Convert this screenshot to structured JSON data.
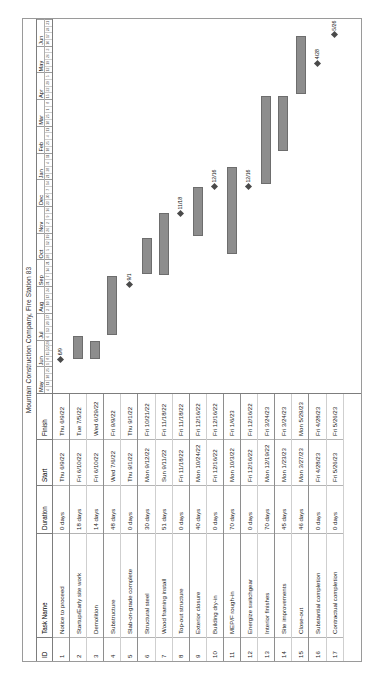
{
  "chart_data": {
    "type": "bar",
    "title": "Mountain Construction Company, Fire Station 83",
    "xlabel": "",
    "ylabel": "",
    "orientation": "horizontal",
    "timeline_start": "2022-05",
    "timeline_end": "2023-06",
    "months": [
      "May",
      "Jun",
      "Jul",
      "Aug",
      "Sep",
      "Oct",
      "Nov",
      "Dec",
      "Jan",
      "Feb",
      "Mar",
      "Apr",
      "May",
      "Jun"
    ],
    "columns": [
      "ID",
      "Task Name",
      "Duration",
      "Start",
      "Finish"
    ],
    "categories": [
      "Notice to proceed",
      "Startup/Early site work",
      "Demolition",
      "Substructure",
      "Slab-on-grade complete",
      "Structural steel",
      "Wood framing install",
      "Top-out structure",
      "Exterior closure",
      "Building dry-in",
      "MEP/F rough-in",
      "Energize switchgear",
      "Interior finishes",
      "Site improvements",
      "Close-out",
      "Substantial completion",
      "Contractual completion"
    ],
    "values": [
      0,
      18,
      14,
      48,
      0,
      30,
      51,
      0,
      40,
      0,
      70,
      0,
      70,
      45,
      46,
      0,
      0
    ],
    "rows": [
      {
        "id": "1",
        "name": "Notice to proceed",
        "duration": "0 days",
        "start": "Thu 6/9/22",
        "finish": "Thu 6/9/22",
        "bar_start": 0.09,
        "bar_end": 0.09,
        "milestone": true,
        "label": "6/9"
      },
      {
        "id": "2",
        "name": "Startup/Early site work",
        "duration": "18 days",
        "start": "Fri 6/10/22",
        "finish": "Tue 7/5/22",
        "bar_start": 0.092,
        "bar_end": 0.152,
        "milestone": false,
        "label": ""
      },
      {
        "id": "3",
        "name": "Demolition",
        "duration": "14 days",
        "start": "Fri 6/10/22",
        "finish": "Wed 6/29/22",
        "bar_start": 0.092,
        "bar_end": 0.138,
        "milestone": false,
        "label": ""
      },
      {
        "id": "4",
        "name": "Substructure",
        "duration": "48 days",
        "start": "Wed 7/6/22",
        "finish": "Fri 9/9/22",
        "bar_start": 0.155,
        "bar_end": 0.312,
        "milestone": false,
        "label": ""
      },
      {
        "id": "5",
        "name": "Slab-on-grade complete",
        "duration": "0 days",
        "start": "Thu 9/1/22",
        "finish": "Thu 9/1/22",
        "bar_start": 0.29,
        "bar_end": 0.29,
        "milestone": true,
        "label": "9/1"
      },
      {
        "id": "6",
        "name": "Structural steel",
        "duration": "30 days",
        "start": "Mon 9/12/22",
        "finish": "Fri 10/21/22",
        "bar_start": 0.318,
        "bar_end": 0.415,
        "milestone": false,
        "label": ""
      },
      {
        "id": "7",
        "name": "Wood framing install",
        "duration": "51 days",
        "start": "Sun 9/11/22",
        "finish": "Fri 11/18/22",
        "bar_start": 0.315,
        "bar_end": 0.48,
        "milestone": false,
        "label": ""
      },
      {
        "id": "8",
        "name": "Top-out structure",
        "duration": "0 days",
        "start": "Fri 11/18/22",
        "finish": "Fri 11/18/22",
        "bar_start": 0.48,
        "bar_end": 0.48,
        "milestone": true,
        "label": "11/18"
      },
      {
        "id": "9",
        "name": "Exterior closure",
        "duration": "40 days",
        "start": "Mon 10/24/22",
        "finish": "Fri 12/16/22",
        "bar_start": 0.42,
        "bar_end": 0.552,
        "milestone": false,
        "label": ""
      },
      {
        "id": "10",
        "name": "Building dry-in",
        "duration": "0 days",
        "start": "Fri 12/16/22",
        "finish": "Fri 12/16/22",
        "bar_start": 0.552,
        "bar_end": 0.552,
        "milestone": true,
        "label": "12/16"
      },
      {
        "id": "11",
        "name": "MEP/F rough-in",
        "duration": "70 days",
        "start": "Mon 10/3/22",
        "finish": "Fri 1/6/23",
        "bar_start": 0.372,
        "bar_end": 0.605,
        "milestone": false,
        "label": ""
      },
      {
        "id": "12",
        "name": "Energize switchgear",
        "duration": "0 days",
        "start": "Fri 12/16/22",
        "finish": "Fri 12/16/22",
        "bar_start": 0.552,
        "bar_end": 0.552,
        "milestone": true,
        "label": "12/16"
      },
      {
        "id": "13",
        "name": "Interior finishes",
        "duration": "70 days",
        "start": "Mon 12/19/22",
        "finish": "Fri 3/24/23",
        "bar_start": 0.558,
        "bar_end": 0.793,
        "milestone": false,
        "label": ""
      },
      {
        "id": "14",
        "name": "Site improvements",
        "duration": "45 days",
        "start": "Mon 1/23/23",
        "finish": "Fri 3/24/23",
        "bar_start": 0.648,
        "bar_end": 0.793,
        "milestone": false,
        "label": ""
      },
      {
        "id": "15",
        "name": "Close-out",
        "duration": "46 days",
        "start": "Mon 3/27/23",
        "finish": "Mon 5/29/23",
        "bar_start": 0.8,
        "bar_end": 0.955,
        "milestone": false,
        "label": ""
      },
      {
        "id": "16",
        "name": "Substantial completion",
        "duration": "0 days",
        "start": "Fri 4/28/23",
        "finish": "Fri 4/28/23",
        "bar_start": 0.882,
        "bar_end": 0.882,
        "milestone": true,
        "label": "4/28"
      },
      {
        "id": "17",
        "name": "Contractual completion",
        "duration": "0 days",
        "start": "Fri 5/26/23",
        "finish": "Fri 5/26/23",
        "bar_start": 0.958,
        "bar_end": 0.958,
        "milestone": true,
        "label": "5/26"
      }
    ],
    "grid": true,
    "legend": "none"
  }
}
